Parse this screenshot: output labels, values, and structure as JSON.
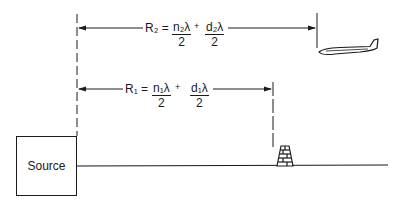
{
  "diagram": {
    "source": {
      "label": "Source"
    },
    "r2": {
      "lhs": "R₂ =",
      "term1": {
        "numerator": "n₂λ",
        "denominator": "2"
      },
      "operator": "+",
      "term2": {
        "numerator": "d₂λ",
        "denominator": "2"
      }
    },
    "r1": {
      "lhs": "R₁ =",
      "term1": {
        "numerator": "n₁λ",
        "denominator": "2"
      },
      "operator": "+",
      "term2": {
        "numerator": "d₁λ",
        "denominator": "2"
      }
    },
    "objects": [
      "airplane-icon",
      "tower-icon"
    ],
    "colors": {
      "ink": "#1a1a1a",
      "background": "#ffffff"
    }
  }
}
